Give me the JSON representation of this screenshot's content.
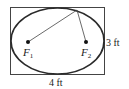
{
  "diagram": {
    "type": "ellipse-in-rectangle",
    "rectangle": {
      "width_label": "4 ft",
      "height_label": "3 ft"
    },
    "foci": [
      {
        "label": "F",
        "subscript": "1"
      },
      {
        "label": "F",
        "subscript": "2"
      }
    ],
    "colors": {
      "stroke": "#333333",
      "ellipse": "#2a2a2a",
      "fill": "#ffffff"
    }
  }
}
